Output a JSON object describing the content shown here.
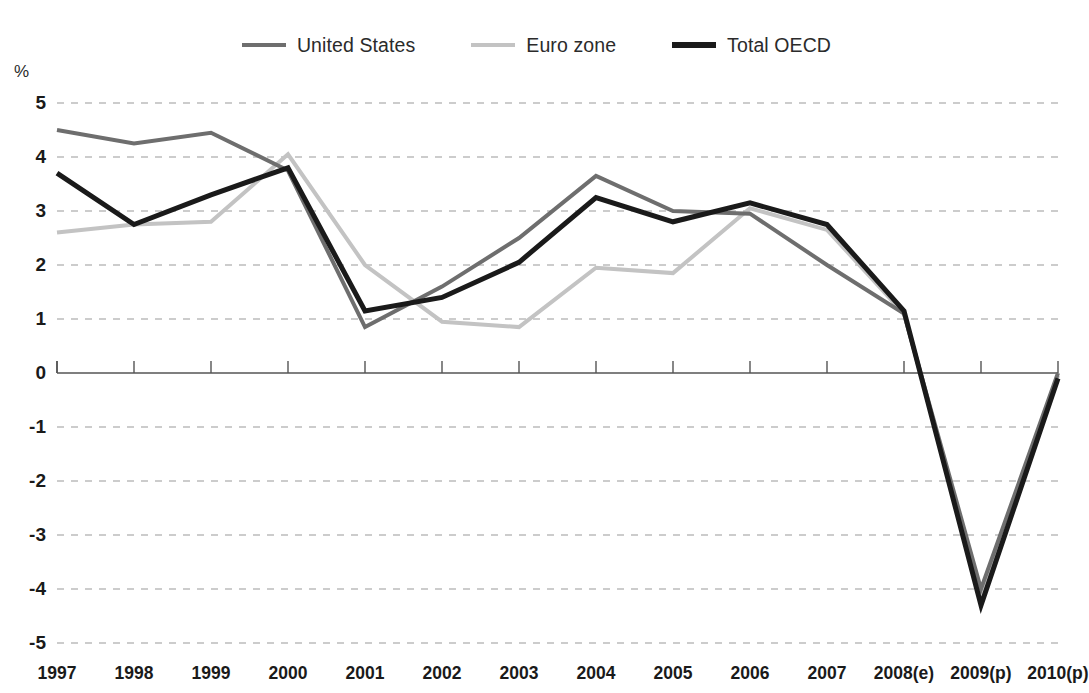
{
  "chart_data": {
    "type": "line",
    "title": "",
    "subtitle": "",
    "xlabel": "",
    "ylabel": "%",
    "unit_label": "%",
    "categories": [
      "1997",
      "1998",
      "1999",
      "2000",
      "2001",
      "2002",
      "2003",
      "2004",
      "2005",
      "2006",
      "2007",
      "2008(e)",
      "2009(p)",
      "2010(p)"
    ],
    "yticks": [
      5,
      4,
      3,
      2,
      1,
      0,
      -1,
      -2,
      -3,
      -4,
      -5
    ],
    "ytick_labels": [
      "5",
      "4",
      "3",
      "2",
      "1",
      "0",
      "-1",
      "-2",
      "-3",
      "-4",
      "-5"
    ],
    "ylim": [
      -5,
      5
    ],
    "grid": true,
    "legend_position": "top-center",
    "series": [
      {
        "name": "United States",
        "color": "#6e6e6e",
        "width": 4,
        "values": [
          4.5,
          4.25,
          4.45,
          3.75,
          0.85,
          1.6,
          2.5,
          3.65,
          3.0,
          2.95,
          2.0,
          1.1,
          -4.0,
          0.0
        ]
      },
      {
        "name": "Euro zone",
        "color": "#c3c3c3",
        "width": 4,
        "values": [
          2.6,
          2.75,
          2.8,
          4.05,
          2.0,
          0.95,
          0.85,
          1.95,
          1.85,
          3.05,
          2.65,
          1.1,
          -4.1,
          -0.05
        ]
      },
      {
        "name": "Total OECD",
        "color": "#1a1a1a",
        "width": 5,
        "values": [
          3.7,
          2.75,
          3.3,
          3.8,
          1.15,
          1.4,
          2.05,
          3.25,
          2.8,
          3.15,
          2.75,
          1.15,
          -4.3,
          -0.1
        ]
      }
    ]
  },
  "legend": {
    "items": [
      {
        "label": "United States",
        "color": "#6e6e6e"
      },
      {
        "label": "Euro zone",
        "color": "#c3c3c3"
      },
      {
        "label": "Total OECD",
        "color": "#1a1a1a"
      }
    ]
  }
}
